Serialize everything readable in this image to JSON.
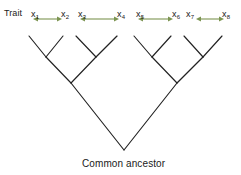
{
  "diagram": {
    "title_label": "Trait",
    "root_label": "Common ancestor",
    "line_color": "#222222",
    "arrow_color": "#7c9451",
    "text_color": "#1a1a1a",
    "background": "#ffffff"
  },
  "traits": [
    {
      "base": "x",
      "sub": "1",
      "x": 31,
      "y": 10
    },
    {
      "base": "x",
      "sub": "2",
      "x": 61,
      "y": 10
    },
    {
      "base": "x",
      "sub": "3",
      "x": 78,
      "y": 10
    },
    {
      "base": "x",
      "sub": "4",
      "x": 117,
      "y": 10
    },
    {
      "base": "x",
      "sub": "5",
      "x": 136,
      "y": 10
    },
    {
      "base": "x",
      "sub": "6",
      "x": 172,
      "y": 10
    },
    {
      "base": "x",
      "sub": "7",
      "x": 186,
      "y": 10
    },
    {
      "base": "x",
      "sub": "8",
      "x": 222,
      "y": 10
    }
  ],
  "arrows": [
    {
      "name": "arrow-x1-x2",
      "x1": 33,
      "x2": 62,
      "y": 19
    },
    {
      "name": "arrow-x3-x4",
      "x1": 80,
      "x2": 119,
      "y": 19
    },
    {
      "name": "arrow-x5-x6",
      "x1": 138,
      "x2": 173,
      "y": 19
    },
    {
      "name": "arrow-x7-x8",
      "x1": 196,
      "x2": 224,
      "y": 19
    }
  ],
  "taxa": [
    {
      "label": "A",
      "x": 26,
      "y": 26,
      "tip_x": 29,
      "tip_y": 36
    },
    {
      "label": "B",
      "x": 60,
      "y": 26,
      "tip_x": 63,
      "tip_y": 36
    },
    {
      "label": "C",
      "x": 73,
      "y": 26,
      "tip_x": 76,
      "tip_y": 36
    },
    {
      "label": "D",
      "x": 114,
      "y": 26,
      "tip_x": 117,
      "tip_y": 36
    },
    {
      "label": "E",
      "x": 131,
      "y": 26,
      "tip_x": 134,
      "tip_y": 36
    },
    {
      "label": "F",
      "x": 168,
      "y": 26,
      "tip_x": 171,
      "tip_y": 36
    },
    {
      "label": "G",
      "x": 181,
      "y": 26,
      "tip_x": 184,
      "tip_y": 36
    },
    {
      "label": "H",
      "x": 219,
      "y": 26,
      "tip_x": 222,
      "tip_y": 36
    }
  ],
  "internal_nodes": [
    {
      "label": "AB",
      "node_x": 46,
      "node_y": 57,
      "text_x": 48,
      "text_y": 54
    },
    {
      "label": "CD",
      "node_x": 96,
      "node_y": 57,
      "text_x": 98,
      "text_y": 54
    },
    {
      "label": "ABCD",
      "node_x": 71,
      "node_y": 83,
      "text_x": 74,
      "text_y": 80
    },
    {
      "label": "EF",
      "node_x": 152,
      "node_y": 57,
      "text_x": 155,
      "text_y": 54
    },
    {
      "label": "GH",
      "node_x": 203,
      "node_y": 57,
      "text_x": 206,
      "text_y": 54
    },
    {
      "label": "EFGH",
      "node_x": 177,
      "node_y": 83,
      "text_x": 180,
      "text_y": 80
    }
  ],
  "root_node": {
    "x": 124,
    "y": 150
  }
}
